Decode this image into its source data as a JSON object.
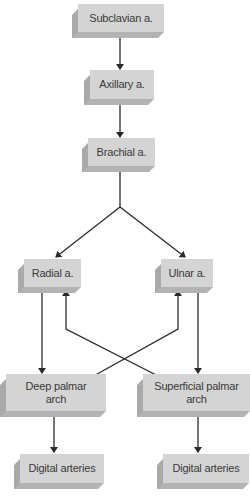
{
  "diagram": {
    "nodes": {
      "subclavian": "Subclavian a.",
      "axillary": "Axillary a.",
      "brachial": "Brachial a.",
      "radial": "Radial a.",
      "ulnar": "Ulnar a.",
      "deep_palmar": "Deep palmar arch",
      "superficial_palmar": "Superficial palmar arch",
      "digital_left": "Digital arteries",
      "digital_right": "Digital arteries"
    },
    "edges": [
      [
        "Subclavian a.",
        "Axillary a."
      ],
      [
        "Axillary a.",
        "Brachial a."
      ],
      [
        "Brachial a.",
        "Radial a."
      ],
      [
        "Brachial a.",
        "Ulnar a."
      ],
      [
        "Radial a.",
        "Deep palmar arch"
      ],
      [
        "Superficial palmar arch",
        "Radial a."
      ],
      [
        "Ulnar a.",
        "Superficial palmar arch"
      ],
      [
        "Deep palmar arch",
        "Ulnar a."
      ],
      [
        "Deep palmar arch",
        "Digital arteries"
      ],
      [
        "Superficial palmar arch",
        "Digital arteries"
      ]
    ],
    "colors": {
      "box_face": "#d4d4d4",
      "box_shadow": "#a9a9a9",
      "line": "#2a2a2a",
      "text": "#3a3a3a"
    }
  }
}
